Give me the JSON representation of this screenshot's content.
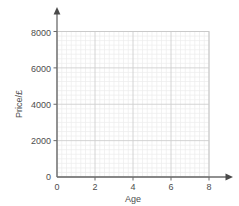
{
  "chart_data": {
    "type": "scatter",
    "title": "",
    "subtitle": "",
    "xlabel": "Age",
    "ylabel": "Price/£",
    "xlim": [
      0,
      8.6
    ],
    "ylim": [
      0,
      8400
    ],
    "x_ticks": [
      "0",
      "2",
      "4",
      "6",
      "8"
    ],
    "x_tick_values": [
      0,
      2,
      4,
      6,
      8
    ],
    "y_ticks": [
      "0",
      "2000",
      "4000",
      "6000",
      "8000"
    ],
    "y_tick_values": [
      0,
      2000,
      4000,
      6000,
      8000
    ],
    "x_major_step": 2,
    "y_major_step": 2000,
    "x_minor_step": 0.25,
    "y_minor_step": 250,
    "grid": true,
    "grid_style": "graph-paper",
    "legend": false,
    "legend_position": "none",
    "series": [
      {
        "name": "",
        "x": [],
        "y": [],
        "values": []
      }
    ],
    "annotations": [],
    "colors": {
      "background": "#ffffff",
      "axis": "#6b6b6b",
      "axis_arrow": "#4a4a4a",
      "grid_minor": "#ececec",
      "grid_major": "#cfcfcf",
      "plot_border": "#c9c9c9",
      "text": "#4d4d4d"
    }
  },
  "axes": {
    "x_axis_label": "Age",
    "y_axis_label": "Price/£",
    "x_axis_arrow": "arrow-right-icon",
    "y_axis_arrow": "arrow-up-icon"
  }
}
